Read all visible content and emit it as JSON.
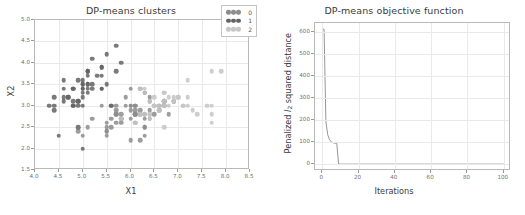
{
  "figure": {
    "panels": [
      {
        "id": "clusters",
        "title": "DP-means clusters",
        "xlabel": "X1",
        "ylabel": "X2"
      },
      {
        "id": "objective",
        "title": "DP-means objective function",
        "xlabel": "Iterations",
        "ylabel_prefix": "Penalized ",
        "ylabel_symbol": "l",
        "ylabel_subscript": "2",
        "ylabel_suffix": " squared distance"
      }
    ]
  },
  "legend": {
    "items": [
      {
        "label": "0",
        "color": "#8c8c8c"
      },
      {
        "label": "1",
        "color": "#636363"
      },
      {
        "label": "2",
        "color": "#c6c6c6"
      }
    ]
  },
  "chart_data": [
    {
      "type": "scatter",
      "title": "DP-means clusters",
      "xlabel": "X1",
      "ylabel": "X2",
      "xlim": [
        4.0,
        8.5
      ],
      "ylim": [
        1.5,
        5.0
      ],
      "xticks": [
        "4.0",
        "4.5",
        "5.0",
        "5.5",
        "6.0",
        "6.5",
        "7.0",
        "7.5",
        "8.0",
        "8.5"
      ],
      "yticks": [
        "1.5",
        "2.0",
        "2.5",
        "3.0",
        "3.5",
        "4.0",
        "4.5",
        "5.0"
      ],
      "grid": true,
      "legend_position": "upper right",
      "series": [
        {
          "name": "0",
          "color": "#8c8c8c",
          "points": [
            [
              5.5,
              2.3
            ],
            [
              6.5,
              2.8
            ],
            [
              5.7,
              2.8
            ],
            [
              6.3,
              3.3
            ],
            [
              4.9,
              2.4
            ],
            [
              6.6,
              2.9
            ],
            [
              5.2,
              2.7
            ],
            [
              5.9,
              3.2
            ],
            [
              6.1,
              2.8
            ],
            [
              6.3,
              2.5
            ],
            [
              6.1,
              2.8
            ],
            [
              6.4,
              2.9
            ],
            [
              6.6,
              3.0
            ],
            [
              6.8,
              2.8
            ],
            [
              6.7,
              3.0
            ],
            [
              6.0,
              2.9
            ],
            [
              5.7,
              2.6
            ],
            [
              5.5,
              2.4
            ],
            [
              5.5,
              2.4
            ],
            [
              5.8,
              2.7
            ],
            [
              6.0,
              2.7
            ],
            [
              5.4,
              3.0
            ],
            [
              6.0,
              3.4
            ],
            [
              6.7,
              3.1
            ],
            [
              6.3,
              2.3
            ],
            [
              5.6,
              3.0
            ],
            [
              5.5,
              2.5
            ],
            [
              5.5,
              2.6
            ],
            [
              6.1,
              3.0
            ],
            [
              5.8,
              2.6
            ],
            [
              5.0,
              2.3
            ],
            [
              5.6,
              2.7
            ],
            [
              5.7,
              3.0
            ],
            [
              5.7,
              2.9
            ],
            [
              6.2,
              2.9
            ],
            [
              5.1,
              2.5
            ],
            [
              5.7,
              2.8
            ],
            [
              6.3,
              3.3
            ],
            [
              5.8,
              2.7
            ],
            [
              6.2,
              2.2
            ],
            [
              6.1,
              2.9
            ],
            [
              6.4,
              2.7
            ],
            [
              6.0,
              2.2
            ],
            [
              6.3,
              2.8
            ],
            [
              6.1,
              3.0
            ],
            [
              6.4,
              2.8
            ],
            [
              6.0,
              3.0
            ],
            [
              6.9,
              3.1
            ],
            [
              6.7,
              3.1
            ],
            [
              5.8,
              2.8
            ],
            [
              6.2,
              2.8
            ],
            [
              6.1,
              2.6
            ],
            [
              6.4,
              3.1
            ],
            [
              6.0,
              3.0
            ],
            [
              6.3,
              2.5
            ],
            [
              6.2,
              3.4
            ],
            [
              5.9,
              3.0
            ],
            [
              6.5,
              3.0
            ],
            [
              6.4,
              3.2
            ],
            [
              6.9,
              3.1
            ],
            [
              5.6,
              2.5
            ],
            [
              6.3,
              2.7
            ],
            [
              6.1,
              2.8
            ]
          ]
        },
        {
          "name": "1",
          "color": "#636363",
          "points": [
            [
              5.1,
              3.5
            ],
            [
              4.9,
              3.0
            ],
            [
              4.7,
              3.2
            ],
            [
              4.6,
              3.1
            ],
            [
              5.0,
              3.6
            ],
            [
              5.4,
              3.9
            ],
            [
              4.6,
              3.4
            ],
            [
              5.0,
              3.4
            ],
            [
              4.4,
              2.9
            ],
            [
              4.9,
              3.1
            ],
            [
              5.4,
              3.7
            ],
            [
              4.8,
              3.4
            ],
            [
              4.8,
              3.0
            ],
            [
              4.3,
              3.0
            ],
            [
              5.8,
              4.0
            ],
            [
              5.7,
              4.4
            ],
            [
              5.4,
              3.9
            ],
            [
              5.1,
              3.5
            ],
            [
              5.7,
              3.8
            ],
            [
              5.1,
              3.8
            ],
            [
              5.4,
              3.4
            ],
            [
              5.1,
              3.7
            ],
            [
              4.6,
              3.6
            ],
            [
              5.1,
              3.3
            ],
            [
              4.8,
              3.4
            ],
            [
              5.0,
              3.0
            ],
            [
              5.0,
              3.4
            ],
            [
              5.2,
              3.5
            ],
            [
              5.2,
              3.4
            ],
            [
              4.7,
              3.2
            ],
            [
              4.8,
              3.1
            ],
            [
              5.4,
              3.4
            ],
            [
              5.2,
              4.1
            ],
            [
              5.5,
              4.2
            ],
            [
              4.9,
              3.1
            ],
            [
              5.0,
              3.2
            ],
            [
              5.5,
              3.5
            ],
            [
              4.9,
              3.6
            ],
            [
              4.4,
              3.0
            ],
            [
              5.1,
              3.4
            ],
            [
              5.0,
              3.5
            ],
            [
              4.5,
              2.3
            ],
            [
              4.4,
              3.2
            ],
            [
              5.0,
              3.5
            ],
            [
              5.1,
              3.8
            ],
            [
              4.8,
              3.0
            ],
            [
              5.1,
              3.8
            ],
            [
              4.6,
              3.2
            ],
            [
              5.3,
              3.7
            ],
            [
              5.0,
              3.3
            ],
            [
              5.0,
              2.0
            ],
            [
              4.9,
              2.5
            ],
            [
              5.6,
              3.0
            ]
          ]
        },
        {
          "name": "2",
          "color": "#c6c6c6",
          "points": [
            [
              6.3,
              3.3
            ],
            [
              7.1,
              3.0
            ],
            [
              6.5,
              3.0
            ],
            [
              7.6,
              3.0
            ],
            [
              7.3,
              2.9
            ],
            [
              6.7,
              2.5
            ],
            [
              7.2,
              3.6
            ],
            [
              6.5,
              3.2
            ],
            [
              6.4,
              2.7
            ],
            [
              6.8,
              3.0
            ],
            [
              7.7,
              3.8
            ],
            [
              7.7,
              2.6
            ],
            [
              6.9,
              3.2
            ],
            [
              7.7,
              2.8
            ],
            [
              6.7,
              3.3
            ],
            [
              7.2,
              3.2
            ],
            [
              6.2,
              2.8
            ],
            [
              6.4,
              2.8
            ],
            [
              7.2,
              3.0
            ],
            [
              7.4,
              2.8
            ],
            [
              7.9,
              3.8
            ],
            [
              6.4,
              2.8
            ],
            [
              6.3,
              2.8
            ],
            [
              6.1,
              2.6
            ],
            [
              7.7,
              3.0
            ],
            [
              6.3,
              3.4
            ],
            [
              6.4,
              3.1
            ],
            [
              6.9,
              3.1
            ],
            [
              6.7,
              3.1
            ],
            [
              6.9,
              3.1
            ],
            [
              5.8,
              2.7
            ],
            [
              6.8,
              3.2
            ],
            [
              6.7,
              3.3
            ],
            [
              6.7,
              3.0
            ],
            [
              6.5,
              3.0
            ],
            [
              6.2,
              3.4
            ],
            [
              7.0,
              3.2
            ],
            [
              6.6,
              3.0
            ],
            [
              7.0,
              3.2
            ],
            [
              6.6,
              2.9
            ],
            [
              7.1,
              3.0
            ]
          ]
        }
      ]
    },
    {
      "type": "line",
      "title": "DP-means objective function",
      "xlabel": "Iterations",
      "ylabel": "Penalized l2 squared distance",
      "xlim": [
        -4,
        104
      ],
      "ylim": [
        -30,
        640
      ],
      "xticks": [
        "0",
        "20",
        "40",
        "60",
        "80",
        "100"
      ],
      "yticks": [
        "0",
        "100",
        "200",
        "300",
        "400",
        "500",
        "600"
      ],
      "grid": true,
      "color": "#8a8a8a",
      "x": [
        0,
        1,
        2,
        3,
        4,
        5,
        6,
        7,
        8,
        9,
        10,
        12,
        15,
        20,
        30,
        40,
        50,
        60,
        70,
        80,
        90,
        100
      ],
      "values": [
        612,
        612,
        195,
        135,
        112,
        102,
        98,
        96,
        95,
        2,
        1,
        1,
        1,
        1,
        1,
        1,
        1,
        1,
        1,
        1,
        1,
        1
      ]
    }
  ]
}
